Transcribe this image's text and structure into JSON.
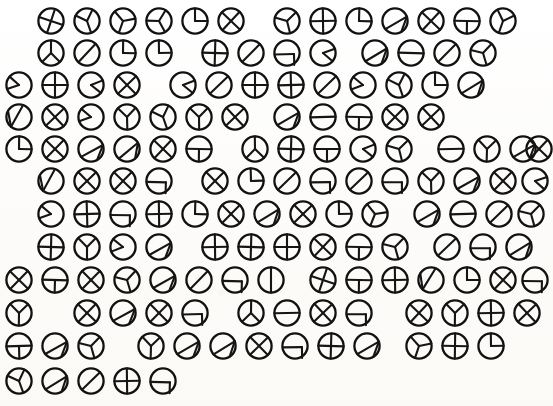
{
  "sheet": {
    "title": "Circle Symbol Sheet",
    "description": "Hand-drawn grid of circles, each divided by chords and radii into sectors",
    "width": 553,
    "height": 406,
    "background_color": "#fdfdfb",
    "ink_color": "#151515",
    "glyph_diameter": 30,
    "row_count": 12,
    "total_glyphs": 122
  },
  "legend": {
    "shape_kinds": [
      "plus",
      "cross",
      "vertical-half",
      "horizontal-half",
      "diagonal-half",
      "quarter",
      "pie-slice",
      "tri-spoke",
      "y-spoke",
      "chord-arc",
      "t-bar",
      "l-corner"
    ]
  },
  "rows": [
    {
      "index": 0,
      "y": 6,
      "glyphs": [
        {
          "x": 36,
          "kind": "plus",
          "rot": 20
        },
        {
          "x": 72,
          "kind": "y-spoke",
          "rot": 160
        },
        {
          "x": 108,
          "kind": "tri-spoke",
          "rot": 200
        },
        {
          "x": 144,
          "kind": "tri-spoke",
          "rot": 150
        },
        {
          "x": 180,
          "kind": "quarter",
          "rot": 0
        },
        {
          "x": 216,
          "kind": "cross",
          "rot": 0
        },
        {
          "x": 272,
          "kind": "tri-spoke",
          "rot": 45
        },
        {
          "x": 308,
          "kind": "plus",
          "rot": 0
        },
        {
          "x": 344,
          "kind": "quarter",
          "rot": 0
        },
        {
          "x": 380,
          "kind": "chord-arc",
          "rot": 30
        },
        {
          "x": 416,
          "kind": "cross",
          "rot": 0
        },
        {
          "x": 452,
          "kind": "t-bar",
          "rot": 0
        },
        {
          "x": 488,
          "kind": "y-spoke",
          "rot": 200
        }
      ]
    },
    {
      "index": 1,
      "y": 38,
      "glyphs": [
        {
          "x": 36,
          "kind": "y-spoke",
          "rot": 0
        },
        {
          "x": 72,
          "kind": "diagonal-half",
          "rot": 0
        },
        {
          "x": 108,
          "kind": "quarter",
          "rot": 0
        },
        {
          "x": 144,
          "kind": "quarter",
          "rot": 0
        },
        {
          "x": 200,
          "kind": "plus",
          "rot": 0
        },
        {
          "x": 236,
          "kind": "diagonal-half",
          "rot": 0
        },
        {
          "x": 272,
          "kind": "l-corner",
          "rot": 0
        },
        {
          "x": 308,
          "kind": "pie-slice",
          "rot": 0
        },
        {
          "x": 360,
          "kind": "chord-arc",
          "rot": 30
        },
        {
          "x": 396,
          "kind": "horizontal-half",
          "rot": 0
        },
        {
          "x": 432,
          "kind": "diagonal-half",
          "rot": 0
        },
        {
          "x": 468,
          "kind": "tri-spoke",
          "rot": 45
        }
      ]
    },
    {
      "index": 2,
      "y": 70,
      "glyphs": [
        {
          "x": 4,
          "kind": "pie-slice",
          "rot": 180
        },
        {
          "x": 40,
          "kind": "plus",
          "rot": 0
        },
        {
          "x": 76,
          "kind": "pie-slice",
          "rot": 0
        },
        {
          "x": 112,
          "kind": "cross",
          "rot": 0
        },
        {
          "x": 168,
          "kind": "pie-slice",
          "rot": 0
        },
        {
          "x": 204,
          "kind": "diagonal-half",
          "rot": 0
        },
        {
          "x": 240,
          "kind": "plus",
          "rot": 0
        },
        {
          "x": 276,
          "kind": "plus",
          "rot": 0
        },
        {
          "x": 312,
          "kind": "diagonal-half",
          "rot": 0
        },
        {
          "x": 348,
          "kind": "pie-slice",
          "rot": 180
        },
        {
          "x": 384,
          "kind": "y-spoke",
          "rot": 160
        },
        {
          "x": 420,
          "kind": "quarter",
          "rot": 0
        },
        {
          "x": 456,
          "kind": "chord-arc",
          "rot": 30
        }
      ]
    },
    {
      "index": 3,
      "y": 102,
      "glyphs": [
        {
          "x": 4,
          "kind": "chord-arc",
          "rot": 180
        },
        {
          "x": 40,
          "kind": "cross",
          "rot": 0
        },
        {
          "x": 76,
          "kind": "pie-slice",
          "rot": 180
        },
        {
          "x": 112,
          "kind": "y-spoke",
          "rot": 180
        },
        {
          "x": 148,
          "kind": "y-spoke",
          "rot": 160
        },
        {
          "x": 184,
          "kind": "y-spoke",
          "rot": 180
        },
        {
          "x": 220,
          "kind": "cross",
          "rot": 0
        },
        {
          "x": 272,
          "kind": "chord-arc",
          "rot": 30
        },
        {
          "x": 308,
          "kind": "horizontal-half",
          "rot": 0
        },
        {
          "x": 344,
          "kind": "t-bar",
          "rot": 0
        },
        {
          "x": 380,
          "kind": "cross",
          "rot": 0
        },
        {
          "x": 416,
          "kind": "cross",
          "rot": 0
        }
      ]
    },
    {
      "index": 4,
      "y": 134,
      "glyphs": [
        {
          "x": 4,
          "kind": "quarter",
          "rot": 0
        },
        {
          "x": 40,
          "kind": "cross",
          "rot": 0
        },
        {
          "x": 76,
          "kind": "chord-arc",
          "rot": 30
        },
        {
          "x": 112,
          "kind": "chord-arc",
          "rot": 20
        },
        {
          "x": 148,
          "kind": "cross",
          "rot": 0
        },
        {
          "x": 184,
          "kind": "t-bar",
          "rot": 0
        },
        {
          "x": 240,
          "kind": "y-spoke",
          "rot": 0
        },
        {
          "x": 276,
          "kind": "plus",
          "rot": 0
        },
        {
          "x": 312,
          "kind": "t-bar",
          "rot": 0
        },
        {
          "x": 348,
          "kind": "pie-slice",
          "rot": 0
        },
        {
          "x": 384,
          "kind": "tri-spoke",
          "rot": 45
        },
        {
          "x": 436,
          "kind": "horizontal-half",
          "rot": 0
        },
        {
          "x": 472,
          "kind": "y-spoke",
          "rot": 180
        },
        {
          "x": 508,
          "kind": "chord-arc",
          "rot": 30
        },
        {
          "x": 524,
          "kind": "cross",
          "rot": 0
        }
      ]
    },
    {
      "index": 5,
      "y": 166,
      "glyphs": [
        {
          "x": 36,
          "kind": "chord-arc",
          "rot": 180
        },
        {
          "x": 72,
          "kind": "cross",
          "rot": 0
        },
        {
          "x": 108,
          "kind": "cross",
          "rot": 0
        },
        {
          "x": 144,
          "kind": "l-corner",
          "rot": 0
        },
        {
          "x": 200,
          "kind": "cross",
          "rot": 0
        },
        {
          "x": 236,
          "kind": "quarter",
          "rot": 0
        },
        {
          "x": 272,
          "kind": "diagonal-half",
          "rot": 0
        },
        {
          "x": 308,
          "kind": "l-corner",
          "rot": 0
        },
        {
          "x": 344,
          "kind": "diagonal-half",
          "rot": 0
        },
        {
          "x": 380,
          "kind": "l-corner",
          "rot": 0
        },
        {
          "x": 416,
          "kind": "y-spoke",
          "rot": 180
        },
        {
          "x": 452,
          "kind": "chord-arc",
          "rot": 30
        },
        {
          "x": 488,
          "kind": "cross",
          "rot": 0
        },
        {
          "x": 520,
          "kind": "pie-slice",
          "rot": 0
        }
      ]
    },
    {
      "index": 6,
      "y": 199,
      "glyphs": [
        {
          "x": 36,
          "kind": "pie-slice",
          "rot": 180
        },
        {
          "x": 72,
          "kind": "plus",
          "rot": 0
        },
        {
          "x": 108,
          "kind": "l-corner",
          "rot": 0
        },
        {
          "x": 144,
          "kind": "plus",
          "rot": 0
        },
        {
          "x": 180,
          "kind": "quarter",
          "rot": 0
        },
        {
          "x": 216,
          "kind": "cross",
          "rot": 0
        },
        {
          "x": 252,
          "kind": "chord-arc",
          "rot": 30
        },
        {
          "x": 288,
          "kind": "cross",
          "rot": 0
        },
        {
          "x": 324,
          "kind": "quarter",
          "rot": 0
        },
        {
          "x": 360,
          "kind": "tri-spoke",
          "rot": 200
        },
        {
          "x": 412,
          "kind": "chord-arc",
          "rot": 30
        },
        {
          "x": 448,
          "kind": "horizontal-half",
          "rot": 0
        },
        {
          "x": 484,
          "kind": "diagonal-half",
          "rot": 0
        },
        {
          "x": 516,
          "kind": "tri-spoke",
          "rot": 45
        }
      ]
    },
    {
      "index": 7,
      "y": 232,
      "glyphs": [
        {
          "x": 36,
          "kind": "plus",
          "rot": 0
        },
        {
          "x": 72,
          "kind": "y-spoke",
          "rot": 180
        },
        {
          "x": 108,
          "kind": "pie-slice",
          "rot": 180
        },
        {
          "x": 144,
          "kind": "chord-arc",
          "rot": 30
        },
        {
          "x": 200,
          "kind": "plus",
          "rot": 0
        },
        {
          "x": 236,
          "kind": "plus",
          "rot": 0
        },
        {
          "x": 272,
          "kind": "plus",
          "rot": 0
        },
        {
          "x": 308,
          "kind": "cross",
          "rot": 0
        },
        {
          "x": 344,
          "kind": "t-bar",
          "rot": 0
        },
        {
          "x": 380,
          "kind": "tri-spoke",
          "rot": 45
        },
        {
          "x": 432,
          "kind": "diagonal-half",
          "rot": 0
        },
        {
          "x": 468,
          "kind": "l-corner",
          "rot": 0
        },
        {
          "x": 504,
          "kind": "chord-arc",
          "rot": 30
        }
      ]
    },
    {
      "index": 8,
      "y": 265,
      "glyphs": [
        {
          "x": 4,
          "kind": "cross",
          "rot": 0
        },
        {
          "x": 40,
          "kind": "t-bar",
          "rot": 0
        },
        {
          "x": 76,
          "kind": "cross",
          "rot": 0
        },
        {
          "x": 112,
          "kind": "tri-spoke",
          "rot": 45
        },
        {
          "x": 148,
          "kind": "chord-arc",
          "rot": 30
        },
        {
          "x": 184,
          "kind": "diagonal-half",
          "rot": 0
        },
        {
          "x": 220,
          "kind": "l-corner",
          "rot": 0
        },
        {
          "x": 256,
          "kind": "vertical-half",
          "rot": 0
        },
        {
          "x": 308,
          "kind": "plus",
          "rot": 20
        },
        {
          "x": 344,
          "kind": "t-bar",
          "rot": 0
        },
        {
          "x": 380,
          "kind": "plus",
          "rot": 0
        },
        {
          "x": 416,
          "kind": "chord-arc",
          "rot": 180
        },
        {
          "x": 452,
          "kind": "quarter",
          "rot": 0
        },
        {
          "x": 488,
          "kind": "cross",
          "rot": 0
        },
        {
          "x": 520,
          "kind": "l-corner",
          "rot": 0
        }
      ]
    },
    {
      "index": 9,
      "y": 298,
      "glyphs": [
        {
          "x": 4,
          "kind": "y-spoke",
          "rot": 180
        },
        {
          "x": 72,
          "kind": "cross",
          "rot": 0
        },
        {
          "x": 108,
          "kind": "chord-arc",
          "rot": 30
        },
        {
          "x": 144,
          "kind": "cross",
          "rot": 0
        },
        {
          "x": 180,
          "kind": "l-corner",
          "rot": 0
        },
        {
          "x": 236,
          "kind": "y-spoke",
          "rot": 0
        },
        {
          "x": 272,
          "kind": "horizontal-half",
          "rot": 0
        },
        {
          "x": 308,
          "kind": "cross",
          "rot": 0
        },
        {
          "x": 344,
          "kind": "l-corner",
          "rot": 0
        },
        {
          "x": 404,
          "kind": "cross",
          "rot": 0
        },
        {
          "x": 440,
          "kind": "y-spoke",
          "rot": 180
        },
        {
          "x": 476,
          "kind": "plus",
          "rot": 0
        },
        {
          "x": 512,
          "kind": "cross",
          "rot": 0
        }
      ]
    },
    {
      "index": 10,
      "y": 331,
      "glyphs": [
        {
          "x": 4,
          "kind": "t-bar",
          "rot": 0
        },
        {
          "x": 40,
          "kind": "chord-arc",
          "rot": 30
        },
        {
          "x": 76,
          "kind": "tri-spoke",
          "rot": 45
        },
        {
          "x": 136,
          "kind": "y-spoke",
          "rot": 180
        },
        {
          "x": 172,
          "kind": "chord-arc",
          "rot": 30
        },
        {
          "x": 208,
          "kind": "chord-arc",
          "rot": 30
        },
        {
          "x": 244,
          "kind": "cross",
          "rot": 0
        },
        {
          "x": 280,
          "kind": "l-corner",
          "rot": 0
        },
        {
          "x": 316,
          "kind": "plus",
          "rot": 0
        },
        {
          "x": 352,
          "kind": "chord-arc",
          "rot": 30
        },
        {
          "x": 404,
          "kind": "tri-spoke",
          "rot": 200
        },
        {
          "x": 440,
          "kind": "plus",
          "rot": 0
        },
        {
          "x": 476,
          "kind": "quarter",
          "rot": 0
        }
      ]
    },
    {
      "index": 11,
      "y": 366,
      "glyphs": [
        {
          "x": 4,
          "kind": "y-spoke",
          "rot": 160
        },
        {
          "x": 40,
          "kind": "chord-arc",
          "rot": 30
        },
        {
          "x": 76,
          "kind": "diagonal-half",
          "rot": 0
        },
        {
          "x": 112,
          "kind": "plus",
          "rot": 0
        },
        {
          "x": 148,
          "kind": "l-corner",
          "rot": 0
        }
      ]
    }
  ]
}
